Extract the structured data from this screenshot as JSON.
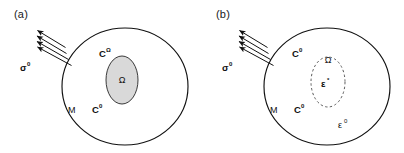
{
  "figure": {
    "type": "schematic-diagram",
    "background_color": "#ffffff",
    "line_color": "#111111",
    "inclusion_fill_color": "#d9d9d9"
  },
  "panels": [
    {
      "id": "a",
      "label": "(a)",
      "matrix_body": {
        "shape": "circle",
        "label_material": "M",
        "label_stiffness_base": "C",
        "label_stiffness_sup": "0"
      },
      "inclusion": {
        "shape": "ellipse",
        "style": "solid",
        "filled": true,
        "region_label": "Ω",
        "stiffness_base": "C",
        "stiffness_sup": "Ω"
      },
      "loading": {
        "symbol_base": "σ",
        "symbol_sup": "0",
        "arrow_count": 4,
        "direction": "up-left"
      }
    },
    {
      "id": "b",
      "label": "(b)",
      "matrix_body": {
        "shape": "circle",
        "label_material": "M",
        "label_stiffness_base": "C",
        "label_stiffness_sup": "0",
        "strain_base": "ε",
        "strain_sup": "0"
      },
      "inclusion": {
        "shape": "ellipse",
        "style": "dashed",
        "filled": false,
        "region_label": "Ω",
        "stiffness_base": "C",
        "stiffness_sup": "0",
        "eigenstrain_base": "ε",
        "eigenstrain_sup": "*"
      },
      "loading": {
        "symbol_base": "σ",
        "symbol_sup": "0",
        "arrow_count": 4,
        "direction": "up-left"
      }
    }
  ]
}
